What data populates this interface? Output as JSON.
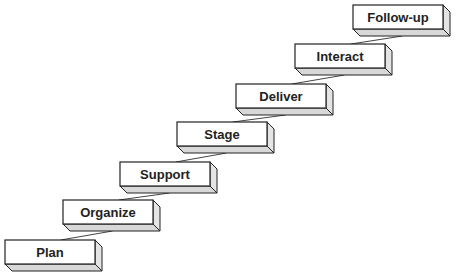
{
  "diagram": {
    "type": "staircase",
    "steps": [
      {
        "label": "Plan",
        "x": 5,
        "y": 240
      },
      {
        "label": "Organize",
        "x": 63,
        "y": 200
      },
      {
        "label": "Support",
        "x": 120,
        "y": 162
      },
      {
        "label": "Stage",
        "x": 177,
        "y": 122
      },
      {
        "label": "Deliver",
        "x": 236,
        "y": 84
      },
      {
        "label": "Interact",
        "x": 295,
        "y": 44
      },
      {
        "label": "Follow-up",
        "x": 353,
        "y": 5
      }
    ],
    "box": {
      "w": 90,
      "h": 24,
      "depth": 7
    },
    "colors": {
      "stroke": "#222222",
      "face": "#ffffff",
      "side": "#e4e4e4",
      "bottom": "#d8d8d8",
      "connector": "#444444"
    }
  }
}
